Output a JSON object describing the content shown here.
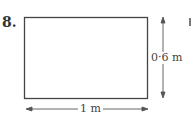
{
  "problem": {
    "number": "8.",
    "width_label": "1 m",
    "height_label": "0·6 m"
  }
}
